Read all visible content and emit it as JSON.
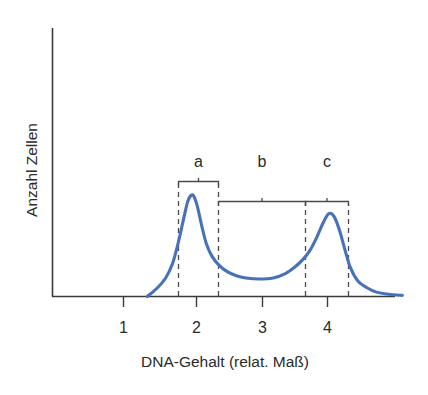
{
  "chart_data": {
    "type": "line",
    "title": "",
    "xlabel": "DNA-Gehalt (relat. Maß)",
    "ylabel": "Anzahl Zellen",
    "xlim": [
      0.55,
      5.25
    ],
    "ylim": [
      0,
      1.12
    ],
    "grid": false,
    "legend": null,
    "xticks": [
      1,
      2,
      3,
      4
    ],
    "xtick_labels": [
      "1",
      "2",
      "3",
      "4"
    ],
    "yticks": [],
    "ytick_labels": [],
    "series": [
      {
        "name": "Zellzahl-Verteilung",
        "color": "#4872b8",
        "x": [
          1.35,
          1.5,
          1.62,
          1.72,
          1.8,
          1.88,
          1.95,
          2.02,
          2.08,
          2.15,
          2.22,
          2.3,
          2.4,
          2.52,
          2.66,
          2.8,
          3.0,
          3.2,
          3.38,
          3.52,
          3.64,
          3.74,
          3.84,
          3.94,
          4.02,
          4.1,
          4.18,
          4.26,
          4.34,
          4.45,
          4.58,
          4.72,
          4.9,
          5.1
        ],
        "y": [
          0.0,
          0.08,
          0.17,
          0.3,
          0.48,
          0.7,
          0.88,
          0.93,
          0.84,
          0.65,
          0.48,
          0.37,
          0.29,
          0.23,
          0.19,
          0.17,
          0.16,
          0.17,
          0.21,
          0.27,
          0.34,
          0.42,
          0.54,
          0.68,
          0.76,
          0.73,
          0.6,
          0.42,
          0.26,
          0.14,
          0.08,
          0.04,
          0.02,
          0.01
        ]
      }
    ],
    "peaks": [
      {
        "label": "G1-Peak",
        "x": 2.03,
        "y": 0.93
      },
      {
        "label": "G2/M-Peak",
        "x": 4.02,
        "y": 0.76
      }
    ],
    "trough": {
      "x": 3.0,
      "y": 0.16
    },
    "guide_lines": {
      "style": "dashed",
      "x_positions": [
        1.8,
        2.4,
        3.72,
        4.3
      ]
    },
    "brackets": [
      {
        "label": "a",
        "x_start": 1.8,
        "x_end": 2.4,
        "y": 1.03,
        "label_x": 2.1,
        "label_y": 1.12
      },
      {
        "label": "b",
        "x_start": 2.4,
        "x_end": 3.72,
        "y": 0.95,
        "label_x": 3.01,
        "label_y": 1.12
      },
      {
        "label": "c",
        "x_start": 3.72,
        "x_end": 4.3,
        "y": 0.95,
        "label_x": 4.03,
        "label_y": 1.12
      }
    ],
    "annotations": [
      {
        "text": "a",
        "meaning": "G1-Phase"
      },
      {
        "text": "b",
        "meaning": "S-Phase"
      },
      {
        "text": "c",
        "meaning": "G2/M-Phase"
      }
    ]
  },
  "axes": {
    "y_axis_label": "Anzahl Zellen",
    "x_axis_label": "DNA-Gehalt (relat. Maß)",
    "tick_labels": [
      "1",
      "2",
      "3",
      "4"
    ]
  },
  "bracket_labels": {
    "a": "a",
    "b": "b",
    "c": "c"
  },
  "colors": {
    "curve": "#4872b8",
    "axis": "#3a3a3a",
    "guide": "#4a4a4a",
    "text": "#2b2b2b",
    "background": "#ffffff"
  }
}
